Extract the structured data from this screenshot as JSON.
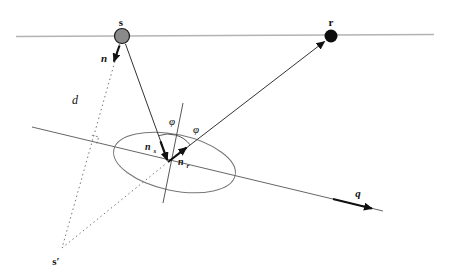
{
  "figure": {
    "labels": {
      "source": "s",
      "receiver": "r",
      "image_source": "s′",
      "surface_normal": "n",
      "perpendicular_distance": "d",
      "angle_incidence": "φ",
      "angle_reflection": "φ",
      "incident_vector_main": "n",
      "incident_vector_sub": "s",
      "reflected_vector_main": "n",
      "reflected_vector_sub": "r",
      "interface_vector": "q"
    },
    "colors": {
      "background": "#ffffff",
      "acquisition_surface_line": "#b3b3b3",
      "interface_line": "#666666",
      "ray_line": "#333333",
      "dotted_line": "#777777",
      "source_fill": "#8a8a8a",
      "receiver_fill": "#0d0d0d",
      "arrow_fill": "#111111"
    }
  }
}
